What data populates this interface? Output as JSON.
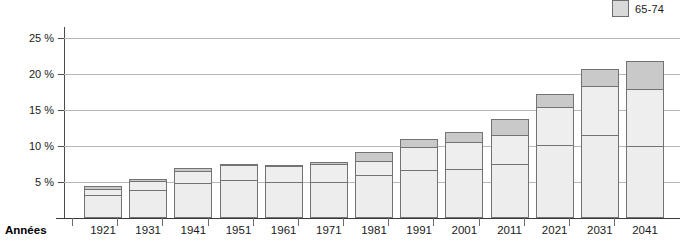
{
  "legend": {
    "swatch_name": "age-group-swatch",
    "label": "65-74",
    "color": "#d9d9d9"
  },
  "axes": {
    "x_axis_title": "Années",
    "y_tick_labels": [
      "25 %",
      "20 %",
      "15 %",
      "10 %",
      "5 %"
    ],
    "y_tick_values": [
      25,
      20,
      15,
      10,
      5
    ]
  },
  "chart_data": {
    "type": "bar",
    "title": "",
    "subtitle": "",
    "xlabel": "Années",
    "ylabel": "",
    "ylim": [
      0,
      26.5
    ],
    "grid": true,
    "stacked": true,
    "legend_position": "top-right",
    "legend_entries": [
      "65-74"
    ],
    "categories": [
      "1921",
      "1931",
      "1941",
      "1951",
      "1961",
      "1971",
      "1981",
      "1991",
      "2001",
      "2011",
      "2021",
      "2031",
      "2041"
    ],
    "series": [
      {
        "name": "65-74",
        "segment": "bottom",
        "color": "#ededed",
        "values": [
          3.2,
          3.9,
          4.8,
          5.3,
          5.0,
          5.0,
          6.0,
          6.6,
          6.8,
          7.5,
          10.1,
          11.5,
          10.0
        ]
      },
      {
        "name": "75-84",
        "segment": "middle",
        "color": "#eeeeee",
        "values": [
          1.0,
          1.4,
          1.9,
          2.2,
          2.4,
          2.6,
          2.1,
          3.4,
          3.9,
          4.1,
          5.4,
          7.0,
          8.0
        ]
      },
      {
        "name": "85+",
        "segment": "top",
        "color": "#c9c9c9",
        "values": [
          0.5,
          0.4,
          0.5,
          0.3,
          0.2,
          0.4,
          1.3,
          1.2,
          1.5,
          2.4,
          2.0,
          2.5,
          4.0
        ]
      }
    ],
    "totals": [
      4.7,
      5.7,
      7.2,
      7.8,
      7.6,
      8.0,
      9.4,
      11.2,
      12.2,
      14.0,
      17.5,
      21.0,
      22.0
    ]
  }
}
